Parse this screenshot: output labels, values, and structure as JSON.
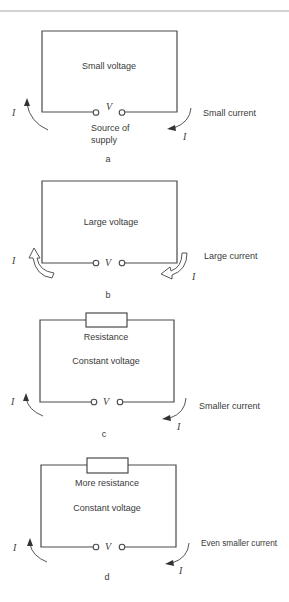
{
  "panels": [
    {
      "id": "a",
      "caption": "a",
      "center_label": "Small voltage",
      "side_label": "Small current",
      "terminal_label": "V",
      "current_symbol": "I",
      "source_label_line1": "Source of",
      "source_label_line2": "supply",
      "arrow_style": "thin"
    },
    {
      "id": "b",
      "caption": "b",
      "center_label": "Large voltage",
      "side_label": "Large current",
      "terminal_label": "V",
      "current_symbol": "I",
      "arrow_style": "thick"
    },
    {
      "id": "c",
      "caption": "c",
      "resistor_label": "Resistance",
      "center_label": "Constant voltage",
      "side_label": "Smaller current",
      "terminal_label": "V",
      "current_symbol": "I",
      "arrow_style": "thin"
    },
    {
      "id": "d",
      "caption": "d",
      "resistor_label": "More resistance",
      "center_label": "Constant voltage",
      "side_label": "Even smaller current",
      "terminal_label": "V",
      "current_symbol": "I",
      "arrow_style": "thin"
    }
  ],
  "colors": {
    "line": "#4a4a4a",
    "text": "#3a3a3a",
    "rule": "#a8a8a8",
    "background": "#ffffff"
  }
}
